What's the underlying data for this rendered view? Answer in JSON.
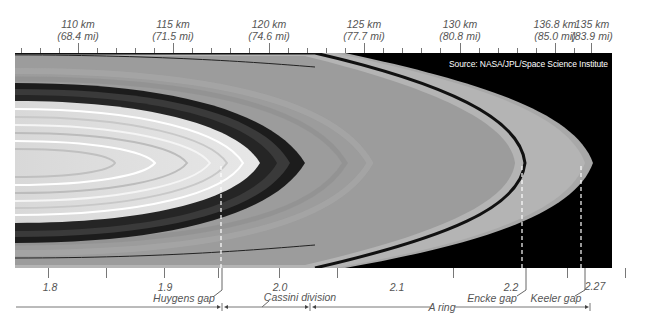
{
  "top_scale": {
    "labels": [
      {
        "km": "110 km",
        "mi": "(68.4 mi)",
        "x": 78
      },
      {
        "km": "115 km",
        "mi": "(71.5 mi)",
        "x": 173
      },
      {
        "km": "120 km",
        "mi": "(74.6 mi)",
        "x": 269
      },
      {
        "km": "125 km",
        "mi": "(77.7 mi)",
        "x": 364
      },
      {
        "km": "130 km",
        "mi": "(80.8 mi)",
        "x": 460
      },
      {
        "km": "136.8 km",
        "mi": "(85.0 mi)",
        "x": 555
      },
      {
        "km": "135 km",
        "mi": "(83.9 mi)",
        "x": 591
      }
    ]
  },
  "source_credit": "Source: NASA/JPL/Space Science Institute",
  "bottom_scale": {
    "labels": [
      {
        "text": "1.8",
        "x": 48
      },
      {
        "text": "1.9",
        "x": 164
      },
      {
        "text": "2.0",
        "x": 279
      },
      {
        "text": "2.1",
        "x": 395
      },
      {
        "text": "2.2",
        "x": 510
      },
      {
        "text": "2.27",
        "x": 592
      }
    ]
  },
  "features": {
    "huygens_gap": "Huygens gap",
    "cassini_division": "Cassini division",
    "a_ring": "A ring",
    "encke_gap": "Encke gap",
    "keeler_gap": "Keeler gap"
  },
  "colors": {
    "background": "#ffffff",
    "space": "#000000",
    "ring_gray": "#9a9a9a",
    "b_ring_light": "#e8e8e8"
  }
}
